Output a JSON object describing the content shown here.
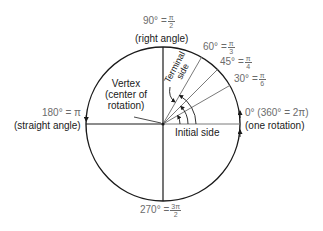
{
  "diagram": {
    "center": {
      "x": 163,
      "y": 124
    },
    "radius": 77,
    "colors": {
      "axis": "#1a1a1a",
      "ray": "#7a7a7a",
      "text_gray": "#6b6b6b",
      "text_dark": "#1a1a1a"
    },
    "labels": {
      "deg90": "90° =",
      "deg90_num": "π",
      "deg90_den": "2",
      "right_angle": "(right angle)",
      "deg60": "60° =",
      "deg60_num": "π",
      "deg60_den": "3",
      "deg45": "45° =",
      "deg45_num": "π",
      "deg45_den": "4",
      "deg30": "30° =",
      "deg30_num": "π",
      "deg30_den": "6",
      "deg0": "0° (360° = 2π)",
      "one_rotation": "(one rotation)",
      "deg180": "180° = π",
      "straight_angle": "(straight angle)",
      "deg270": "270° =",
      "deg270_num": "3π",
      "deg270_den": "2",
      "vertex_line1": "Vertex",
      "vertex_line2": "(center of",
      "vertex_line3": "rotation)",
      "initial_side": "Initial side",
      "terminal_line1": "Terminal",
      "terminal_line2": "side"
    },
    "rays_degrees": [
      30,
      45,
      60
    ]
  }
}
